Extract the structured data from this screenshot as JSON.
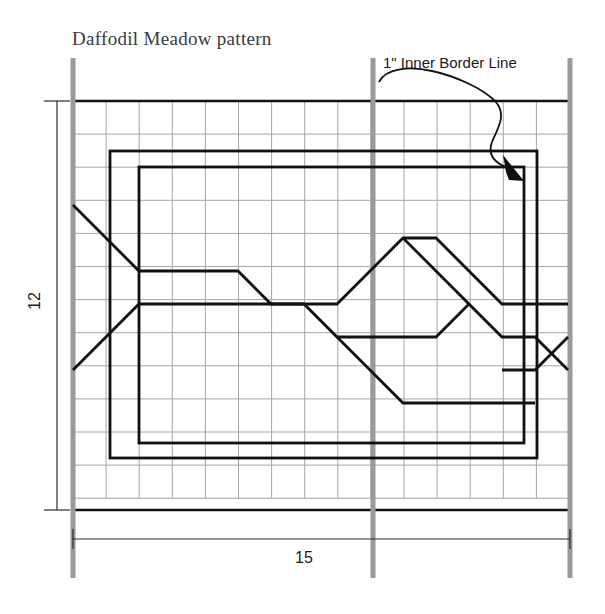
{
  "page": {
    "title": "Daffodil Meadow pattern",
    "background_color": "#ffffff"
  },
  "annotations": {
    "callout_label": "1\" Inner Border Line",
    "width_dimension": "15",
    "height_dimension": "12"
  },
  "colors": {
    "grid_line": "#a6a6a6",
    "guide_line": "#9a9a9a",
    "pattern_line": "#111111",
    "dimension_line": "#2b2b2b",
    "title_text": "#3a3a3a",
    "label_text": "#1a1a1a"
  },
  "chart_data": {
    "type": "table",
    "title": "Daffodil Meadow pattern",
    "xlabel": "15",
    "ylabel": "12",
    "grid": {
      "columns": 15,
      "rows": 12,
      "cell_size_px": 33.1,
      "origin_x_px": 73,
      "origin_y_px": 101,
      "on": true
    },
    "vertical_guides_px": [
      73,
      373,
      570
    ],
    "borders": [
      {
        "name": "outer-border",
        "x": 110,
        "y": 151,
        "w": 427,
        "h": 307
      },
      {
        "name": "inner-border",
        "x": 139,
        "y": 167,
        "w": 385,
        "h": 276
      }
    ],
    "motif_paths": [
      {
        "name": "upper-zigzag",
        "points": "73,205 139,271 205,271 238,271 271,304 337,304 370,271 403,271 436,337 502,337 535,337 568,370"
      },
      {
        "name": "lower-zigzag",
        "points": "73,370 139,304 205,304 271,304 304,337 370,337 403,370 436,403 535,403"
      }
    ],
    "callout": {
      "text": "1\" Inner Border Line",
      "anchor_px": [
        524,
        178
      ],
      "leader_style": "squiggle-with-arrow"
    },
    "dimensions": [
      {
        "label": "15",
        "orientation": "horizontal",
        "from_px": [
          73,
          539
        ],
        "to_px": [
          570,
          539
        ]
      },
      {
        "label": "12",
        "orientation": "vertical",
        "from_px": [
          57,
          101
        ],
        "to_px": [
          57,
          510
        ]
      }
    ]
  }
}
